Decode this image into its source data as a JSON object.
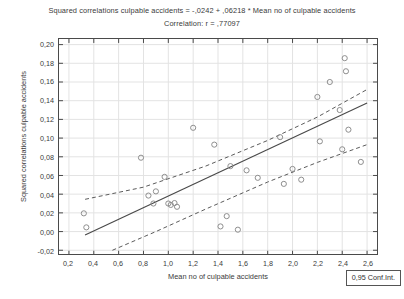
{
  "titles": {
    "main": "Squared correlations culpable accidents = -,0242 + ,06218 * Mean no of culpable accidents",
    "sub": "Correlation: r = ,77097"
  },
  "legend": {
    "label": "0,95 Conf.Int."
  },
  "axes": {
    "x_label": "Mean no of culpable accidents",
    "y_label": "Squared correlations culpable accidents",
    "x_ticks": [
      "0,2",
      "0,4",
      "0,6",
      "0,8",
      "1,0",
      "1,2",
      "1,4",
      "1,6",
      "1,8",
      "2,0",
      "2,2",
      "2,4",
      "2,6"
    ],
    "y_ticks": [
      "0,20",
      "0,18",
      "0,16",
      "0,14",
      "0,12",
      "0,10",
      "0,08",
      "0,06",
      "0,04",
      "0,02",
      "0,00",
      "-0,02"
    ]
  },
  "colors": {
    "frame": "#4a4a4a",
    "grid": "#e3e3e3",
    "marker": "#8d8d8d",
    "fit_line": "#4a4a4a",
    "ci_line": "#5a5a5a",
    "text": "#3a3a3a"
  },
  "chart_data": {
    "type": "scatter",
    "title": "Squared correlations culpable accidents = -,0242 + ,06218 * Mean no of culpable accidents",
    "subtitle": "Correlation: r = ,77097",
    "xlabel": "Mean no of culpable accidents",
    "ylabel": "Squared correlations culpable accidents",
    "xlim": [
      0.12,
      2.68
    ],
    "ylim": [
      -0.024,
      0.206
    ],
    "xticks": [
      0.2,
      0.4,
      0.6,
      0.8,
      1.0,
      1.2,
      1.4,
      1.6,
      1.8,
      2.0,
      2.2,
      2.4,
      2.6
    ],
    "yticks": [
      -0.02,
      0.0,
      0.02,
      0.04,
      0.06,
      0.08,
      0.1,
      0.12,
      0.14,
      0.16,
      0.18,
      0.2
    ],
    "grid": true,
    "legend": "0,95 Conf.Int.",
    "legend_position": "bottom-right-outside",
    "correlation_r": 0.77097,
    "regression": {
      "intercept": -0.0242,
      "slope": 0.06218,
      "label": "y = -,0242 + ,06218 * x",
      "x_range": [
        0.33,
        2.6
      ]
    },
    "confidence_interval": {
      "level": 0.95,
      "style": "dashed",
      "upper": [
        {
          "x": 0.33,
          "y": 0.0345
        },
        {
          "x": 0.8,
          "y": 0.0475
        },
        {
          "x": 1.3,
          "y": 0.07
        },
        {
          "x": 1.8,
          "y": 0.0975
        },
        {
          "x": 2.2,
          "y": 0.1225
        },
        {
          "x": 2.6,
          "y": 0.152
        }
      ],
      "lower": [
        {
          "x": 0.55,
          "y": -0.02
        },
        {
          "x": 0.9,
          "y": 0.0
        },
        {
          "x": 1.3,
          "y": 0.024
        },
        {
          "x": 1.8,
          "y": 0.053
        },
        {
          "x": 2.2,
          "y": 0.074
        },
        {
          "x": 2.6,
          "y": 0.093
        }
      ]
    },
    "points": [
      {
        "x": 0.32,
        "y": 0.0195
      },
      {
        "x": 0.34,
        "y": 0.0045
      },
      {
        "x": 0.78,
        "y": 0.079
      },
      {
        "x": 0.84,
        "y": 0.0385
      },
      {
        "x": 0.88,
        "y": 0.03
      },
      {
        "x": 0.9,
        "y": 0.043
      },
      {
        "x": 0.97,
        "y": 0.0585
      },
      {
        "x": 1.0,
        "y": 0.03
      },
      {
        "x": 1.02,
        "y": 0.0285
      },
      {
        "x": 1.05,
        "y": 0.0305
      },
      {
        "x": 1.07,
        "y": 0.0265
      },
      {
        "x": 1.2,
        "y": 0.111
      },
      {
        "x": 1.37,
        "y": 0.093
      },
      {
        "x": 1.42,
        "y": 0.0055
      },
      {
        "x": 1.47,
        "y": 0.0165
      },
      {
        "x": 1.5,
        "y": 0.07
      },
      {
        "x": 1.56,
        "y": 0.002
      },
      {
        "x": 1.63,
        "y": 0.0655
      },
      {
        "x": 1.72,
        "y": 0.0575
      },
      {
        "x": 1.9,
        "y": 0.101
      },
      {
        "x": 1.93,
        "y": 0.051
      },
      {
        "x": 2.0,
        "y": 0.067
      },
      {
        "x": 2.07,
        "y": 0.0555
      },
      {
        "x": 2.2,
        "y": 0.144
      },
      {
        "x": 2.22,
        "y": 0.0965
      },
      {
        "x": 2.3,
        "y": 0.16
      },
      {
        "x": 2.38,
        "y": 0.13
      },
      {
        "x": 2.4,
        "y": 0.088
      },
      {
        "x": 2.42,
        "y": 0.1855
      },
      {
        "x": 2.43,
        "y": 0.1715
      },
      {
        "x": 2.45,
        "y": 0.109
      },
      {
        "x": 2.55,
        "y": 0.0745
      }
    ]
  }
}
